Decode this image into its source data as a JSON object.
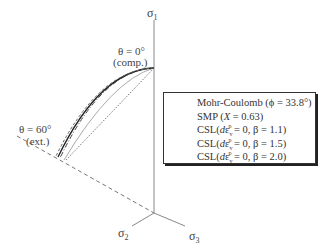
{
  "diagram": {
    "type": "deviatoric-plane failure criteria in principal stress space",
    "axes": {
      "sigma1": {
        "label": "σ",
        "sub": "1"
      },
      "sigma2": {
        "label": "σ",
        "sub": "2"
      },
      "sigma3": {
        "label": "σ",
        "sub": "3"
      }
    },
    "annotations": {
      "theta0": "θ = 0°",
      "theta0_note": "(comp.)",
      "theta60": "θ = 60°",
      "theta60_note": "(ext.)"
    },
    "legend": {
      "items": [
        {
          "style": "dotted",
          "color": "#555555",
          "text": "Mohr-Coulomb (ϕ = 33.8°)"
        },
        {
          "style": "solid-light",
          "color": "#aaaaaa",
          "text_pre": "SMP (",
          "text_var": "X",
          "text_post": " = 0.63)"
        },
        {
          "style": "dash-dot",
          "color": "#444444",
          "text_pre": "CSL(",
          "text_var": "d",
          "text_eps": "ε",
          "text_sup": "p",
          "text_sub": "v",
          "text_post": " = 0, β = 1.1)"
        },
        {
          "style": "solid-dark",
          "color": "#222222",
          "text_pre": "CSL(",
          "text_var": "d",
          "text_eps": "ε",
          "text_sup": "p",
          "text_sub": "v",
          "text_post": " = 0, β = 1.5)"
        },
        {
          "style": "dashed",
          "color": "#666666",
          "text_pre": "CSL(",
          "text_var": "d",
          "text_eps": "ε",
          "text_sup": "p",
          "text_sub": "v",
          "text_post": " = 0, β = 2.0)"
        }
      ]
    },
    "colors": {
      "axis": "#888888",
      "dashed_ref": "#777777",
      "legend_border": "#333333"
    }
  }
}
